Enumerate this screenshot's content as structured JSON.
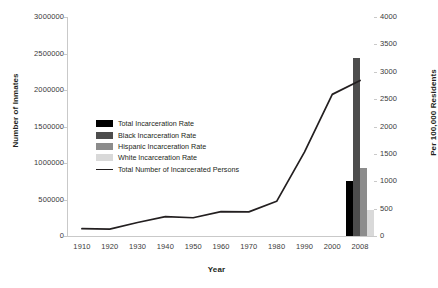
{
  "chart_data": {
    "type": "line",
    "title": "",
    "xlabel": "Year",
    "ylabel": "Number of Inmates",
    "y2label": "Per 100,000 Residents",
    "grid": false,
    "legend_position": "center-left",
    "categories": [
      "1910",
      "1920",
      "1930",
      "1940",
      "1950",
      "1960",
      "1970",
      "1980",
      "1990",
      "2000",
      "2008"
    ],
    "x_tick_labels": [
      "1910",
      "1920",
      "1930",
      "1940",
      "1950",
      "1960",
      "1970",
      "1980",
      "1990",
      "2000",
      "2008"
    ],
    "ylim": [
      0,
      3000000
    ],
    "y_tick_labels": [
      "0",
      "500000",
      "1000000",
      "1500000",
      "2000000",
      "2500000",
      "3000000"
    ],
    "y_ticks": [
      0,
      500000,
      1000000,
      1500000,
      2000000,
      2500000,
      3000000
    ],
    "y2lim": [
      0,
      4000
    ],
    "y2_tick_labels": [
      "0",
      "500",
      "1000",
      "1500",
      "2000",
      "2500",
      "3000",
      "3500",
      "4000"
    ],
    "y2_ticks": [
      0,
      500,
      1000,
      1500,
      2000,
      2500,
      3000,
      3500,
      4000
    ],
    "series": [
      {
        "name": "Total Number of Incarcerated Persons",
        "type": "line",
        "axis": "left",
        "color": "#231f20",
        "x": [
          "1910",
          "1920",
          "1930",
          "1940",
          "1950",
          "1960",
          "1970",
          "1980",
          "1990",
          "2000",
          "2008"
        ],
        "values": [
          100000,
          95000,
          185000,
          265000,
          250000,
          335000,
          330000,
          475000,
          1150000,
          1940000,
          2130000
        ]
      },
      {
        "name": "Total Incarceration Rate",
        "type": "bar",
        "axis": "right",
        "color": "#000000",
        "x": [
          "2008"
        ],
        "values": [
          1000
        ]
      },
      {
        "name": "Black Incarceration Rate",
        "type": "bar",
        "axis": "right",
        "color": "#4d4d4d",
        "x": [
          "2008"
        ],
        "values": [
          3260
        ]
      },
      {
        "name": "Hispanic Incarceration Rate",
        "type": "bar",
        "axis": "right",
        "color": "#8c8c8c",
        "x": [
          "2008"
        ],
        "values": [
          1250
        ]
      },
      {
        "name": "White Incarceration Rate",
        "type": "bar",
        "axis": "right",
        "color": "#d9d9d9",
        "x": [
          "2008"
        ],
        "values": [
          480
        ]
      }
    ]
  },
  "legend": {
    "items": [
      {
        "label": "Total Incarceration Rate",
        "color": "#000000",
        "marker": "swatch"
      },
      {
        "label": "Black Incarceration Rate",
        "color": "#4d4d4d",
        "marker": "swatch"
      },
      {
        "label": "Hispanic Incarceration Rate",
        "color": "#8c8c8c",
        "marker": "swatch"
      },
      {
        "label": "White Incarceration Rate",
        "color": "#d9d9d9",
        "marker": "swatch"
      },
      {
        "label": "Total Number of Incarcerated Persons",
        "color": "#231f20",
        "marker": "line"
      }
    ]
  },
  "axes": {
    "left_title": "Number of Inmates",
    "right_title": "Per 100,000 Residents",
    "bottom_title": "Year"
  }
}
